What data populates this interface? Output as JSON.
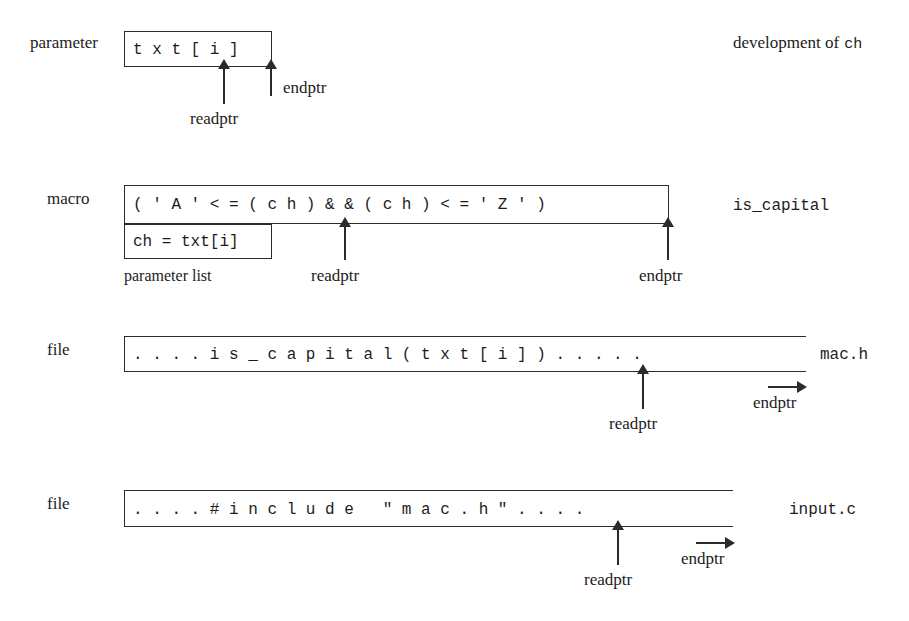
{
  "figure": {
    "background_color": "#ffffff",
    "line_color": "#2b2b2b"
  },
  "rows": [
    {
      "id": "parameter-row",
      "left_label": "parameter",
      "content": "t x t [ i ]",
      "right_label": "development of ch",
      "right_label_plain": "development of",
      "right_label_mono": "ch",
      "box_style": "closed",
      "pointers": [
        {
          "name": "readptr",
          "label": "readptr",
          "kind": "up"
        },
        {
          "name": "endptr",
          "label": "endptr",
          "kind": "up"
        }
      ]
    },
    {
      "id": "macro-row",
      "left_label": "macro",
      "content": "( ' A ' < = ( c h ) & & ( c h ) < = ' Z ' )",
      "right_label": "is_capital",
      "box_style": "closed",
      "sub_box": {
        "content": "ch = txt[i]",
        "caption": "parameter list"
      },
      "pointers": [
        {
          "name": "readptr",
          "label": "readptr",
          "kind": "up"
        },
        {
          "name": "endptr",
          "label": "endptr",
          "kind": "up"
        }
      ]
    },
    {
      "id": "mac-h-row",
      "left_label": "file",
      "content": ". . . . i s _ c a p i t a l ( t x t [ i ] ) . . . . .",
      "right_label": "mac.h",
      "box_style": "open-right",
      "pointers": [
        {
          "name": "readptr",
          "label": "readptr",
          "kind": "up"
        },
        {
          "name": "endptr",
          "label": "endptr",
          "kind": "right"
        }
      ]
    },
    {
      "id": "input-c-row",
      "left_label": "file",
      "content": ". . . . # i n c l u d e   \" m a c . h \" . . . .",
      "right_label": "input.c",
      "box_style": "open-right",
      "pointers": [
        {
          "name": "readptr",
          "label": "readptr",
          "kind": "up"
        },
        {
          "name": "endptr",
          "label": "endptr",
          "kind": "right"
        }
      ]
    }
  ]
}
